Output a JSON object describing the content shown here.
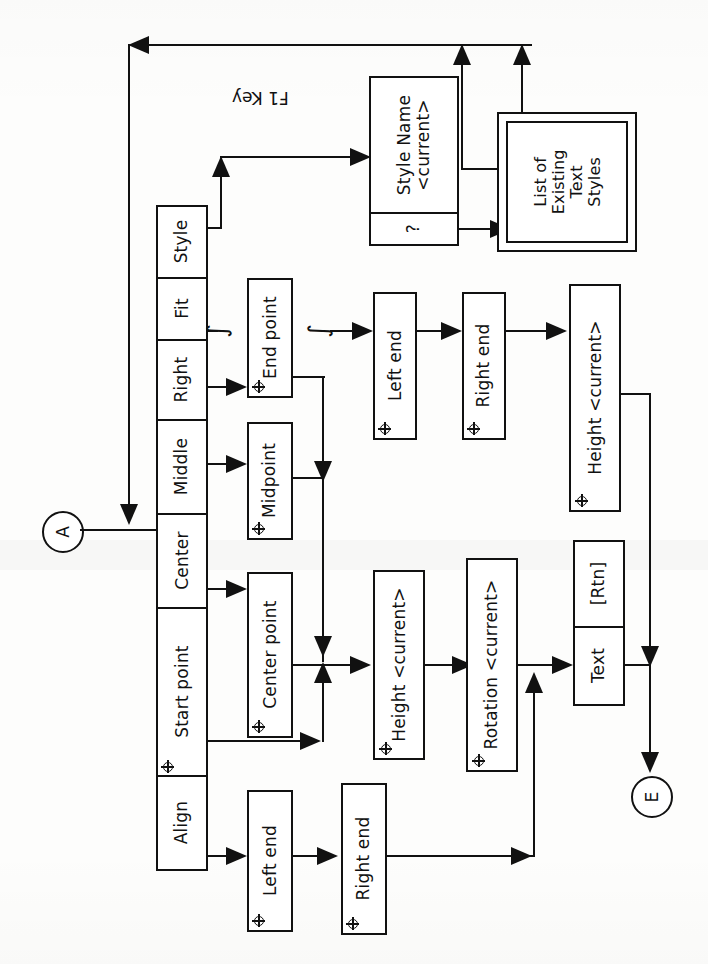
{
  "diagram": {
    "orientation": "rotated-90",
    "top_note": "F1 Key",
    "connectors": {
      "in_label": "A",
      "out_label": "E"
    },
    "break_symbol": "∫"
  },
  "main_column": {
    "name": "text-command-options",
    "cells": [
      {
        "label": "Align",
        "crosshair": false
      },
      {
        "label": "Start point",
        "crosshair": true
      },
      {
        "label": "Center",
        "crosshair": false
      },
      {
        "label": "Middle",
        "crosshair": false
      },
      {
        "label": "Right",
        "crosshair": false
      },
      {
        "label": "Fit",
        "crosshair": false
      },
      {
        "label": "Style",
        "crosshair": false
      }
    ]
  },
  "style_branch": {
    "prompt_box": {
      "line1": "Style Name",
      "line2": "<current>",
      "help_label": "?"
    },
    "list_box": {
      "line1": "List of",
      "line2": "Existing",
      "line3": "Text",
      "line4": "Styles"
    }
  },
  "nodes": {
    "end_point": {
      "label": "End point",
      "crosshair": true
    },
    "midpoint": {
      "label": "Midpoint",
      "crosshair": true
    },
    "center_point": {
      "label": "Center point",
      "crosshair": true
    },
    "align_left_end": {
      "label": "Left end",
      "crosshair": true
    },
    "align_right_end": {
      "label": "Right end",
      "crosshair": true
    },
    "fit_left_end": {
      "label": "Left end",
      "crosshair": true
    },
    "fit_right_end": {
      "label": "Right end",
      "crosshair": true
    },
    "fit_height": {
      "label": "Height <current>",
      "crosshair": true
    },
    "height": {
      "label": "Height <current>",
      "crosshair": true
    },
    "rotation": {
      "label": "Rotation <current>",
      "crosshair": true
    },
    "text_entry": {
      "label": "Text",
      "rtn_label": "[Rtn]"
    }
  },
  "colors": {
    "ink": "#111111",
    "paper": "#fdfdfc"
  }
}
